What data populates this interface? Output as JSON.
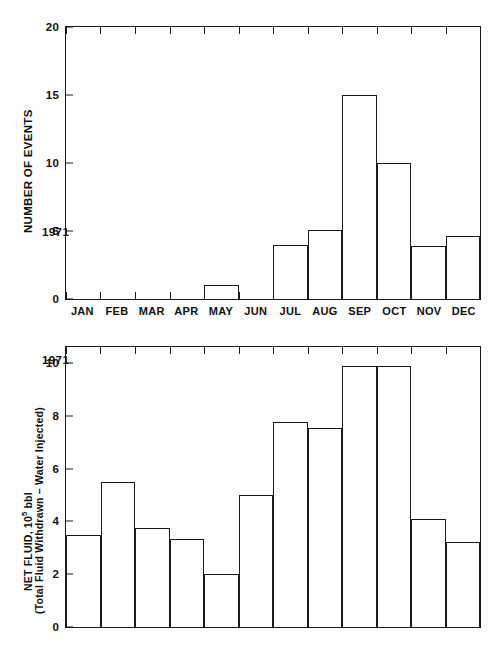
{
  "figure": {
    "year_note": "1971",
    "corner_mark": ""
  },
  "charts": {
    "top": {
      "ylabel": "NUMBER OF EVENTS",
      "yticks": [
        "0",
        "5",
        "10",
        "15",
        "20"
      ],
      "xlabels": [
        "JAN",
        "FEB",
        "MAR",
        "APR",
        "MAY",
        "JUN",
        "JUL",
        "AUG",
        "SEP",
        "OCT",
        "NOV",
        "DEC"
      ],
      "year_note": "1971"
    },
    "bottom": {
      "ylabel_line1_pre": "NET FLUID, 10",
      "ylabel_line1_sup": "5",
      "ylabel_line1_post": " bbl",
      "ylabel_line2": "(Total Fluid Withdrawn – Water Injected)",
      "yticks": [
        "0",
        "2",
        "4",
        "6",
        "8",
        "10"
      ],
      "year_note": "1971"
    }
  },
  "chart_data": [
    {
      "type": "bar",
      "id": "number-of-events-1971",
      "title": "",
      "annotation": "1971",
      "xlabel": "",
      "ylabel": "NUMBER OF EVENTS",
      "categories": [
        "JAN",
        "FEB",
        "MAR",
        "APR",
        "MAY",
        "JUN",
        "JUL",
        "AUG",
        "SEP",
        "OCT",
        "NOV",
        "DEC"
      ],
      "values": [
        0,
        0,
        0,
        0,
        1,
        0,
        4,
        5.1,
        15,
        10,
        3.9,
        4.65
      ],
      "ylim": [
        0,
        20
      ],
      "ytick_values": [
        0,
        5,
        10,
        15,
        20
      ],
      "grid": false,
      "legend": "none",
      "bar_style": "outline"
    },
    {
      "type": "bar",
      "id": "net-fluid-1971",
      "title": "",
      "annotation": "1971",
      "xlabel": "",
      "ylabel": "NET FLUID, 10^5 bbl (Total Fluid Withdrawn – Water Injected)",
      "categories": [
        "JAN",
        "FEB",
        "MAR",
        "APR",
        "MAY",
        "JUN",
        "JUL",
        "AUG",
        "SEP",
        "OCT",
        "NOV",
        "DEC"
      ],
      "values": [
        3.5,
        5.5,
        3.75,
        3.35,
        2.0,
        5.0,
        7.75,
        7.55,
        9.9,
        9.9,
        4.1,
        3.2
      ],
      "ylim": [
        0,
        10.6
      ],
      "ytick_values": [
        0,
        2,
        4,
        6,
        8,
        10
      ],
      "grid": false,
      "legend": "none",
      "bar_style": "outline"
    }
  ]
}
